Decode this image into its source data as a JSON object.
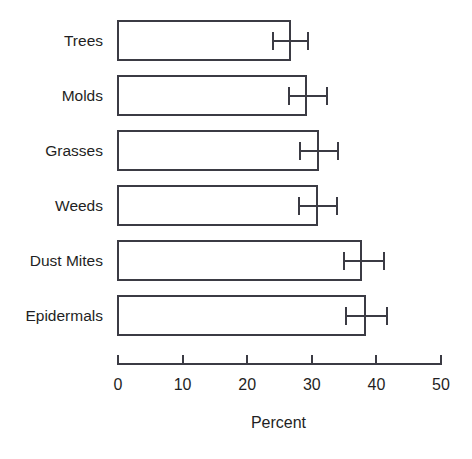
{
  "chart_data": {
    "type": "bar",
    "orientation": "horizontal",
    "title": "",
    "xlabel": "Percent",
    "ylabel": "",
    "xlim": [
      0,
      50
    ],
    "xticks": [
      0,
      10,
      20,
      30,
      40,
      50
    ],
    "grid": false,
    "legend": null,
    "categories": [
      "Trees",
      "Molds",
      "Grasses",
      "Weeds",
      "Dust Mites",
      "Epidermals"
    ],
    "values": [
      26.9,
      29.4,
      31.2,
      31.1,
      37.9,
      38.5
    ],
    "errors_low": [
      24.0,
      26.5,
      28.2,
      28.0,
      35.0,
      35.3
    ],
    "errors_high": [
      29.7,
      32.7,
      34.4,
      34.2,
      41.5,
      42.0
    ],
    "bar_style": {
      "fill": "#ffffff",
      "outline": "#3b3b44"
    }
  },
  "axis": {
    "tick_labels": [
      "0",
      "10",
      "20",
      "30",
      "40",
      "50"
    ],
    "x_title": "Percent"
  }
}
